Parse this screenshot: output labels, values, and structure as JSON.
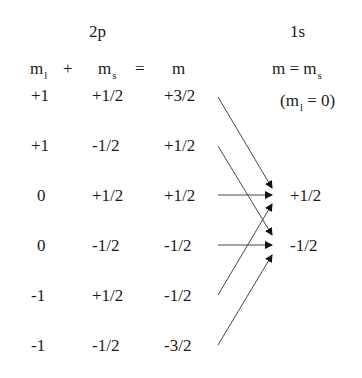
{
  "diagram": {
    "left_header": "2p",
    "right_header": "1s",
    "left_equation": {
      "ml": "m",
      "ml_sub": "l",
      "plus": "+",
      "ms": "m",
      "ms_sub": "s",
      "equals": "=",
      "m": "m"
    },
    "right_equation": {
      "m": "m",
      "equals": "=",
      "ms": "m",
      "ms_sub": "s"
    },
    "right_condition": {
      "open": "(m",
      "sub": "l",
      "rest": " = 0)"
    },
    "rows": [
      {
        "ml": "+1",
        "ms": "+1/2",
        "m": "+3/2"
      },
      {
        "ml": "+1",
        "ms": "-1/2",
        "m": "+1/2"
      },
      {
        "ml": "0",
        "ms": "+1/2",
        "m": "+1/2"
      },
      {
        "ml": "0",
        "ms": "-1/2",
        "m": "-1/2"
      },
      {
        "ml": "-1",
        "ms": "+1/2",
        "m": "-1/2"
      },
      {
        "ml": "-1",
        "ms": "-1/2",
        "m": "-3/2"
      }
    ],
    "targets": [
      {
        "label": "+1/2"
      },
      {
        "label": "-1/2"
      }
    ],
    "arrows": [
      {
        "from_row": 0,
        "to": "+1/2"
      },
      {
        "from_row": 1,
        "to": "-1/2"
      },
      {
        "from_row": 2,
        "to": "+1/2"
      },
      {
        "from_row": 3,
        "to": "-1/2"
      },
      {
        "from_row": 4,
        "to": "+1/2"
      },
      {
        "from_row": 5,
        "to": "-1/2"
      }
    ]
  }
}
